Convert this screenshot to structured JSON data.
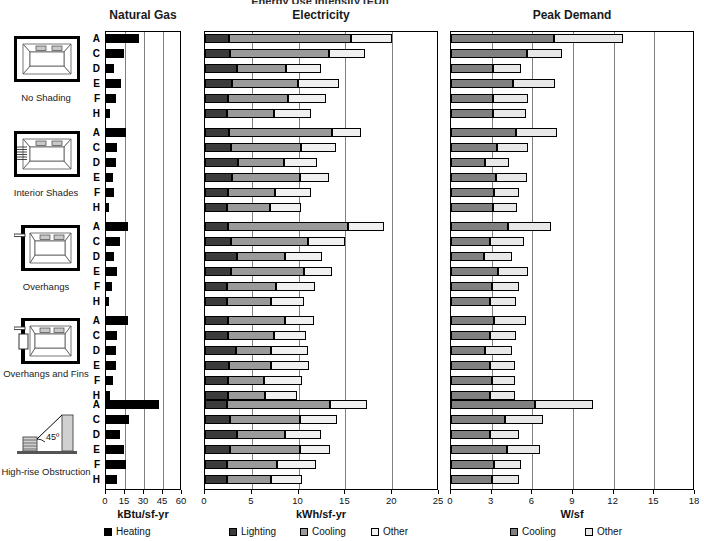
{
  "figure": {
    "cropped_top_title": "Energy Use Intensity  (EUI)",
    "panels": [
      {
        "key": "gas",
        "title": "Natural Gas",
        "axis_title": "kBtu/sf-yr",
        "ticks": [
          0,
          15,
          30,
          45,
          60
        ],
        "xmin": 0,
        "xmax": 60
      },
      {
        "key": "elec",
        "title": "Electricity",
        "axis_title": "kWh/sf-yr",
        "ticks": [
          0,
          5,
          10,
          15,
          20,
          25
        ],
        "xmin": 0,
        "xmax": 25
      },
      {
        "key": "peak",
        "title": "Peak Demand",
        "axis_title": "W/sf",
        "ticks": [
          0,
          3,
          6,
          9,
          12,
          15,
          18
        ],
        "xmin": 0,
        "xmax": 18
      }
    ],
    "legends": {
      "gas": [
        {
          "label": "Heating",
          "color": "#000000"
        }
      ],
      "elec": [
        {
          "label": "Lighting",
          "color": "#3b3b3b"
        },
        {
          "label": "Cooling",
          "color": "#9a9a9a"
        },
        {
          "label": "Other",
          "color": "#f0f0f0"
        }
      ],
      "peak": [
        {
          "label": "Cooling",
          "color": "#808080"
        },
        {
          "label": "Other",
          "color": "#e8e8e8"
        }
      ]
    },
    "row_letters": [
      "A",
      "C",
      "D",
      "E",
      "F",
      "H"
    ],
    "groups": [
      {
        "id": "no-shading",
        "caption": "No Shading",
        "icon": "plan-no-shading-icon"
      },
      {
        "id": "interior-shades",
        "caption": "Interior Shades",
        "icon": "plan-interior-shades-icon"
      },
      {
        "id": "overhangs",
        "caption": "Overhangs",
        "icon": "plan-overhangs-icon"
      },
      {
        "id": "overhangs-and-fins",
        "caption": "Overhangs and Fins",
        "icon": "plan-overhangs-fins-icon"
      },
      {
        "id": "high-rise-obstruction",
        "caption": "High-rise Obstruction",
        "icon": "section-highrise-icon",
        "annotation": "45º"
      }
    ]
  },
  "chart_data": [
    {
      "type": "bar",
      "orientation": "horizontal",
      "title": "Natural Gas",
      "xlabel": "kBtu/sf-yr",
      "ylabel": "",
      "xlim": [
        0,
        60
      ],
      "xticks": [
        0,
        15,
        30,
        45,
        60
      ],
      "grid": true,
      "legend": [
        "Heating"
      ],
      "legend_position": "bottom",
      "series": [
        {
          "name": "Heating",
          "color": "#000000"
        }
      ],
      "groups": [
        {
          "name": "No Shading",
          "categories": [
            "A",
            "C",
            "D",
            "E",
            "F",
            "H"
          ],
          "values": [
            26.0,
            14.5,
            6.0,
            12.0,
            7.5,
            3.0
          ]
        },
        {
          "name": "Interior Shades",
          "categories": [
            "A",
            "C",
            "D",
            "E",
            "F",
            "H"
          ],
          "values": [
            15.5,
            9.0,
            8.0,
            5.5,
            6.5,
            2.0
          ]
        },
        {
          "name": "Overhangs",
          "categories": [
            "A",
            "C",
            "D",
            "E",
            "F",
            "H"
          ],
          "values": [
            17.5,
            11.0,
            6.5,
            8.5,
            4.5,
            2.0
          ]
        },
        {
          "name": "Overhangs and Fins",
          "categories": [
            "A",
            "C",
            "D",
            "E",
            "F",
            "H"
          ],
          "values": [
            17.5,
            9.0,
            7.5,
            8.0,
            5.5,
            3.5
          ]
        },
        {
          "name": "High-rise Obstruction",
          "categories": [
            "A",
            "C",
            "D",
            "E",
            "F",
            "H"
          ],
          "values": [
            42.0,
            18.0,
            11.0,
            14.5,
            15.5,
            9.0
          ]
        }
      ]
    },
    {
      "type": "bar",
      "orientation": "horizontal",
      "stacked": true,
      "title": "Electricity",
      "xlabel": "kWh/sf-yr",
      "ylabel": "",
      "xlim": [
        0,
        25
      ],
      "xticks": [
        0,
        5,
        10,
        15,
        20,
        25
      ],
      "grid": true,
      "legend": [
        "Lighting",
        "Cooling",
        "Other"
      ],
      "legend_position": "bottom",
      "series": [
        {
          "name": "Lighting",
          "color": "#3b3b3b"
        },
        {
          "name": "Cooling",
          "color": "#9a9a9a"
        },
        {
          "name": "Other",
          "color": "#f0f0f0"
        }
      ],
      "groups": [
        {
          "name": "No Shading",
          "categories": [
            "A",
            "C",
            "D",
            "E",
            "F",
            "H"
          ],
          "stacks": [
            [
              2.6,
              13.0,
              4.4
            ],
            [
              2.7,
              10.5,
              3.9
            ],
            [
              3.4,
              5.3,
              3.7
            ],
            [
              2.9,
              7.0,
              4.4
            ],
            [
              2.5,
              6.4,
              4.0
            ],
            [
              2.3,
              5.1,
              3.9
            ]
          ]
        },
        {
          "name": "Interior Shades",
          "categories": [
            "A",
            "C",
            "D",
            "E",
            "F",
            "H"
          ],
          "stacks": [
            [
              2.6,
              11.0,
              3.1
            ],
            [
              2.8,
              7.5,
              3.7
            ],
            [
              3.5,
              4.9,
              3.6
            ],
            [
              2.9,
              7.2,
              3.1
            ],
            [
              2.5,
              5.0,
              3.8
            ],
            [
              2.4,
              4.5,
              3.4
            ]
          ]
        },
        {
          "name": "Overhangs",
          "categories": [
            "A",
            "C",
            "D",
            "E",
            "F",
            "H"
          ],
          "stacks": [
            [
              2.5,
              12.8,
              3.8
            ],
            [
              2.8,
              8.2,
              4.0
            ],
            [
              3.4,
              5.2,
              3.9
            ],
            [
              2.8,
              7.8,
              3.0
            ],
            [
              2.4,
              5.2,
              4.1
            ],
            [
              2.4,
              4.6,
              3.6
            ]
          ]
        },
        {
          "name": "Overhangs and Fins",
          "categories": [
            "A",
            "C",
            "D",
            "E",
            "F",
            "H"
          ],
          "stacks": [
            [
              2.5,
              6.0,
              3.2
            ],
            [
              2.5,
              4.9,
              3.4
            ],
            [
              3.3,
              3.7,
              4.0
            ],
            [
              2.6,
              4.5,
              4.0
            ],
            [
              2.5,
              3.8,
              4.1
            ],
            [
              2.5,
              3.9,
              3.4
            ]
          ]
        },
        {
          "name": "High-rise Obstruction",
          "categories": [
            "A",
            "C",
            "D",
            "E",
            "F",
            "H"
          ],
          "stacks": [
            [
              2.4,
              11.0,
              3.9
            ],
            [
              2.7,
              7.5,
              3.9
            ],
            [
              3.4,
              5.2,
              3.8
            ],
            [
              2.7,
              7.5,
              3.2
            ],
            [
              2.4,
              5.3,
              4.2
            ],
            [
              2.4,
              4.6,
              3.4
            ]
          ]
        }
      ]
    },
    {
      "type": "bar",
      "orientation": "horizontal",
      "stacked": true,
      "title": "Peak Demand",
      "xlabel": "W/sf",
      "ylabel": "",
      "xlim": [
        0,
        18
      ],
      "xticks": [
        0,
        3,
        6,
        9,
        12,
        15,
        18
      ],
      "grid": true,
      "legend": [
        "Cooling",
        "Other"
      ],
      "legend_position": "bottom",
      "series": [
        {
          "name": "Cooling",
          "color": "#808080"
        },
        {
          "name": "Other",
          "color": "#e8e8e8"
        }
      ],
      "groups": [
        {
          "name": "No Shading",
          "categories": [
            "A",
            "C",
            "D",
            "E",
            "F",
            "H"
          ],
          "stacks": [
            [
              7.6,
              5.1
            ],
            [
              5.6,
              2.6
            ],
            [
              3.1,
              2.1
            ],
            [
              4.6,
              3.1
            ],
            [
              3.1,
              2.6
            ],
            [
              3.1,
              2.4
            ]
          ]
        },
        {
          "name": "Interior Shades",
          "categories": [
            "A",
            "C",
            "D",
            "E",
            "F",
            "H"
          ],
          "stacks": [
            [
              4.8,
              3.0
            ],
            [
              3.4,
              2.3
            ],
            [
              2.5,
              1.8
            ],
            [
              3.3,
              2.3
            ],
            [
              3.2,
              1.8
            ],
            [
              3.1,
              1.8
            ]
          ]
        },
        {
          "name": "Overhangs",
          "categories": [
            "A",
            "C",
            "D",
            "E",
            "F",
            "H"
          ],
          "stacks": [
            [
              4.2,
              3.2
            ],
            [
              2.9,
              2.5
            ],
            [
              2.4,
              2.1
            ],
            [
              3.5,
              2.2
            ],
            [
              3.0,
              2.0
            ],
            [
              2.9,
              1.9
            ]
          ]
        },
        {
          "name": "Overhangs and Fins",
          "categories": [
            "A",
            "C",
            "D",
            "E",
            "F",
            "H"
          ],
          "stacks": [
            [
              3.2,
              2.3
            ],
            [
              2.9,
              1.9
            ],
            [
              2.5,
              2.0
            ],
            [
              2.9,
              1.8
            ],
            [
              3.0,
              1.7
            ],
            [
              2.9,
              1.8
            ]
          ]
        },
        {
          "name": "High-rise Obstruction",
          "categories": [
            "A",
            "C",
            "D",
            "E",
            "F",
            "H"
          ],
          "stacks": [
            [
              6.2,
              4.3
            ],
            [
              4.0,
              2.8
            ],
            [
              2.9,
              2.1
            ],
            [
              4.1,
              2.5
            ],
            [
              3.2,
              2.0
            ],
            [
              3.0,
              2.0
            ]
          ]
        }
      ]
    }
  ]
}
